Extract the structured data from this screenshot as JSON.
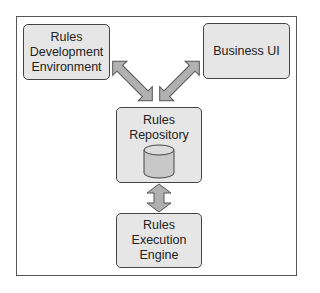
{
  "diagram": {
    "nodes": [
      {
        "id": "dev",
        "lines": [
          "Rules",
          "Development",
          "Environment"
        ]
      },
      {
        "id": "biz",
        "lines": [
          "Business UI"
        ]
      },
      {
        "id": "repo",
        "lines": [
          "Rules",
          "Repository"
        ],
        "icon": "database-cylinder-icon"
      },
      {
        "id": "eng",
        "lines": [
          "Rules Execution",
          "Engine"
        ]
      }
    ],
    "edges": [
      {
        "from": "dev",
        "to": "repo",
        "type": "bidirectional"
      },
      {
        "from": "biz",
        "to": "repo",
        "type": "bidirectional"
      },
      {
        "from": "repo",
        "to": "eng",
        "type": "bidirectional"
      }
    ],
    "colors": {
      "node_fill": "#e6e6e6",
      "node_border": "#444444",
      "arrow_fill": "#b0b0b0",
      "arrow_stroke": "#555555",
      "cylinder_fill": "#c8c8c8"
    }
  }
}
